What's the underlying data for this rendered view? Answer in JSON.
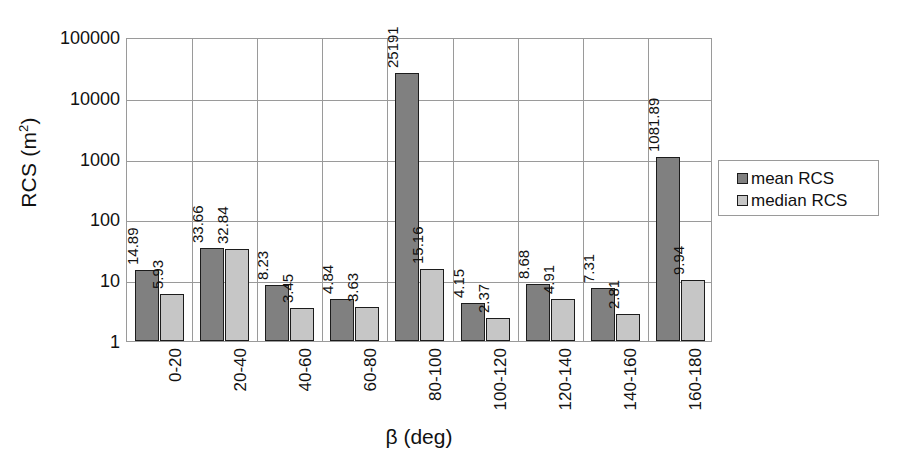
{
  "chart_data": {
    "type": "bar",
    "title": "",
    "xlabel": "β (deg)",
    "ylabel": "RCS (m²)",
    "ylabel_base": "RCS (m",
    "ylabel_sup": "2",
    "ylabel_close": ")",
    "yscale": "log",
    "ylim": [
      1,
      100000
    ],
    "ytick_labels": [
      "100000",
      "10000",
      "1000",
      "100",
      "10",
      "1"
    ],
    "ytick_values": [
      100000,
      10000,
      1000,
      100,
      10,
      1
    ],
    "grid": true,
    "legend_position": "right",
    "categories": [
      "0-20",
      "20-40",
      "40-60",
      "60-80",
      "80-100",
      "100-120",
      "120-140",
      "140-160",
      "160-180"
    ],
    "series": [
      {
        "name": "mean RCS",
        "color": "#808080",
        "values": [
          14.89,
          33.66,
          8.23,
          4.84,
          25191,
          4.15,
          8.68,
          7.31,
          1081.89
        ],
        "labels": [
          "14.89",
          "33.66",
          "8.23",
          "4.84",
          "25191",
          "4.15",
          "8.68",
          "7.31",
          "1081.89"
        ]
      },
      {
        "name": "median RCS",
        "color": "#c6c6c6",
        "values": [
          5.93,
          32.84,
          3.45,
          3.63,
          15.16,
          2.37,
          4.91,
          2.81,
          9.94
        ],
        "labels": [
          "5.93",
          "32.84",
          "3.45",
          "3.63",
          "15.16",
          "2.37",
          "4.91",
          "2.81",
          "9.94"
        ]
      }
    ]
  },
  "legend": {
    "items": [
      {
        "label": "mean RCS",
        "color": "#808080"
      },
      {
        "label": "median RCS",
        "color": "#c6c6c6"
      }
    ]
  }
}
